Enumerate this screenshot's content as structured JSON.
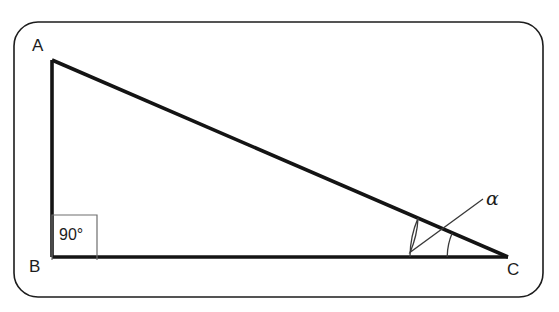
{
  "figure": {
    "kind": "right-triangle-diagram",
    "background_color": "#ffffff",
    "frame": {
      "name": "rounded-rectangle-border",
      "x": 14,
      "y": 22,
      "width": 529,
      "height": 275,
      "corner_radius": 24,
      "stroke_color": "#1c1c1c",
      "stroke_width": 1.6,
      "fill": "none"
    },
    "triangle": {
      "stroke_color": "#141414",
      "stroke_width": 3.6,
      "fill": "none",
      "vertices": [
        {
          "name": "A",
          "label": "A",
          "x": 52,
          "y": 60,
          "label_x": 32,
          "label_y": 51
        },
        {
          "name": "B",
          "label": "B",
          "x": 52,
          "y": 257,
          "label_x": 29,
          "label_y": 272
        },
        {
          "name": "C",
          "label": "C",
          "x": 508,
          "y": 257,
          "label_x": 507,
          "label_y": 275
        }
      ],
      "sides": [
        {
          "name": "side-AB",
          "from": "A",
          "to": "B"
        },
        {
          "name": "side-BC",
          "from": "B",
          "to": "C"
        },
        {
          "name": "side-CA",
          "from": "C",
          "to": "A"
        }
      ]
    },
    "right_angle_marker": {
      "name": "right-angle-square",
      "at_vertex": "B",
      "value_label": "90°",
      "box_x": 52,
      "box_y": 215,
      "box_size": 45,
      "stroke_color": "#6e6e6e",
      "stroke_width": 1.2,
      "text_x": 59,
      "text_y": 240
    },
    "angle_alpha": {
      "name": "angle-alpha-at-C",
      "label": "α",
      "at_vertex": "C",
      "arc_stroke_color": "#3a3a3a",
      "arc_stroke_width": 1.3,
      "inner_arc_radius": 98,
      "outer_arc_radius": 98,
      "label_x": 486,
      "label_y": 205
    }
  }
}
